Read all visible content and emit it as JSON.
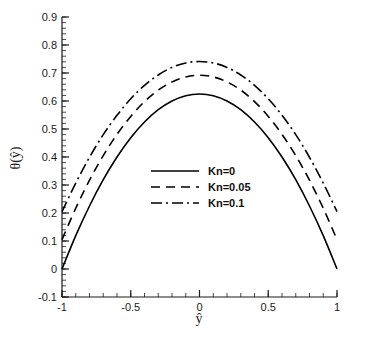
{
  "chart_data": {
    "type": "line",
    "title": "",
    "xlabel": "ŷ",
    "ylabel": "θ(ŷ)",
    "xlim": [
      -1,
      1
    ],
    "ylim": [
      -0.1,
      0.9
    ],
    "grid": false,
    "legend_position": "center",
    "x_ticks": [
      -1,
      -0.5,
      0,
      0.5,
      1
    ],
    "x_tick_labels": [
      "-1",
      "-0.5",
      "0",
      "0.5",
      "1"
    ],
    "x_minor_step": 0.1,
    "y_ticks": [
      -0.1,
      0,
      0.1,
      0.2,
      0.3,
      0.4,
      0.5,
      0.6,
      0.7,
      0.8,
      0.9
    ],
    "y_tick_labels": [
      "-0.1",
      "0",
      "0.1",
      "0.2",
      "0.3",
      "0.4",
      "0.5",
      "0.6",
      "0.7",
      "0.8",
      "0.9"
    ],
    "y_minor_step": 0.02,
    "x": [
      -1,
      -0.9,
      -0.8,
      -0.7,
      -0.6,
      -0.5,
      -0.4,
      -0.3,
      -0.2,
      -0.1,
      0,
      0.1,
      0.2,
      0.3,
      0.4,
      0.5,
      0.6,
      0.7,
      0.8,
      0.9,
      1
    ],
    "series": [
      {
        "name": "Kn=0",
        "style": "solid",
        "color": "#000000",
        "values": [
          0,
          0.119,
          0.225,
          0.319,
          0.4,
          0.469,
          0.525,
          0.569,
          0.6,
          0.619,
          0.625,
          0.619,
          0.6,
          0.569,
          0.525,
          0.469,
          0.4,
          0.319,
          0.225,
          0.119,
          0
        ]
      },
      {
        "name": "Kn=0.05",
        "style": "dashed",
        "color": "#000000",
        "values": [
          0.105,
          0.217,
          0.317,
          0.405,
          0.481,
          0.545,
          0.598,
          0.639,
          0.668,
          0.686,
          0.692,
          0.686,
          0.668,
          0.639,
          0.598,
          0.545,
          0.481,
          0.405,
          0.317,
          0.217,
          0.105
        ]
      },
      {
        "name": "Kn=0.1",
        "style": "dashdot",
        "color": "#000000",
        "values": [
          0.205,
          0.307,
          0.399,
          0.48,
          0.549,
          0.608,
          0.656,
          0.693,
          0.72,
          0.736,
          0.741,
          0.736,
          0.72,
          0.693,
          0.656,
          0.608,
          0.549,
          0.48,
          0.399,
          0.307,
          0.205
        ]
      }
    ],
    "legend": [
      {
        "label": "Kn=0",
        "style": "solid"
      },
      {
        "label": "Kn=0.05",
        "style": "dashed"
      },
      {
        "label": "Kn=0.1",
        "style": "dashdot"
      }
    ]
  },
  "axis": {
    "x_label": "ŷ",
    "y_label": "θ(ŷ)"
  },
  "colors": {
    "background": "#ffffff",
    "axis": "#1a1a1a",
    "curve": "#000000"
  }
}
